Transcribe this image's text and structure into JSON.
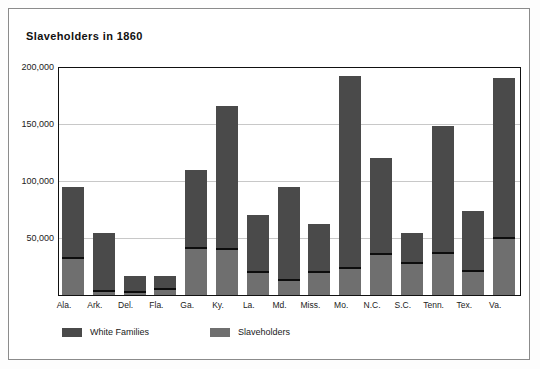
{
  "chart_data": {
    "type": "bar",
    "subtype": "stacked",
    "title": "Slaveholders in 1860",
    "xlabel": "",
    "ylabel": "",
    "ylim": [
      0,
      200000
    ],
    "grid": true,
    "legend_position": "bottom-left",
    "ytick_labels": [
      "200,000",
      "150,000",
      "100,000",
      "50,000"
    ],
    "ytick_values": [
      200000,
      150000,
      100000,
      50000
    ],
    "categories": [
      "Ala.",
      "Ark.",
      "Del.",
      "Fla.",
      "Ga.",
      "Ky.",
      "La.",
      "Md.",
      "Miss.",
      "Mo.",
      "N.C.",
      "S.C.",
      "Tenn.",
      "Tex.",
      "Va."
    ],
    "series": [
      {
        "name": "White Families",
        "color": "#4a4a4a",
        "values": [
          95000,
          54000,
          17000,
          17000,
          110000,
          166000,
          70000,
          95000,
          62000,
          192000,
          120000,
          54000,
          148000,
          74000,
          190000
        ]
      },
      {
        "name": "Slaveholders",
        "color": "#6f6f6f",
        "values": [
          33000,
          4500,
          3500,
          6000,
          42000,
          41000,
          21000,
          14000,
          21000,
          25000,
          37000,
          29000,
          38000,
          22000,
          51000
        ]
      }
    ]
  },
  "legend": {
    "items": [
      {
        "label": "White Families",
        "color": "#4a4a4a"
      },
      {
        "label": "Slaveholders",
        "color": "#6f6f6f"
      }
    ]
  }
}
